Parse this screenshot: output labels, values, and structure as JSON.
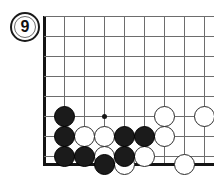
{
  "diagram": {
    "kind": "go-board-diagram",
    "move_label": "9",
    "corner": "bottom-left",
    "board": {
      "origin_x": 44,
      "origin_y": 16,
      "spacing": 20,
      "cols": 9,
      "rows": 8,
      "left_edge_x": 44,
      "bottom_edge_y": 164,
      "line_color": "#6d6d6d",
      "edge_color": "#141414"
    },
    "star_points": [
      {
        "x": 104,
        "y": 116
      }
    ],
    "stone_radius": 10.5,
    "colors": {
      "black_stone": "#1b1b1b",
      "white_stone": "#ffffff",
      "white_stone_border": "#2a2a2a",
      "badge_text": "#111111",
      "background": "#ffffff"
    },
    "stones": [
      {
        "color": "black",
        "x": 64,
        "y": 116
      },
      {
        "color": "white",
        "x": 164,
        "y": 116
      },
      {
        "color": "white",
        "x": 204,
        "y": 116
      },
      {
        "color": "black",
        "x": 64,
        "y": 136
      },
      {
        "color": "white",
        "x": 84,
        "y": 136
      },
      {
        "color": "white",
        "x": 104,
        "y": 136
      },
      {
        "color": "black",
        "x": 124,
        "y": 136
      },
      {
        "color": "black",
        "x": 144,
        "y": 136
      },
      {
        "color": "white",
        "x": 164,
        "y": 136
      },
      {
        "color": "black",
        "x": 64,
        "y": 156
      },
      {
        "color": "black",
        "x": 84,
        "y": 156
      },
      {
        "color": "white",
        "x": 104,
        "y": 156
      },
      {
        "color": "black",
        "x": 124,
        "y": 156
      },
      {
        "color": "white",
        "x": 144,
        "y": 156
      },
      {
        "color": "black",
        "x": 104,
        "y": 164
      },
      {
        "color": "white",
        "x": 124,
        "y": 164
      },
      {
        "color": "white",
        "x": 184,
        "y": 164
      }
    ],
    "badge": {
      "left": 10,
      "top": 12,
      "size": 30
    }
  }
}
